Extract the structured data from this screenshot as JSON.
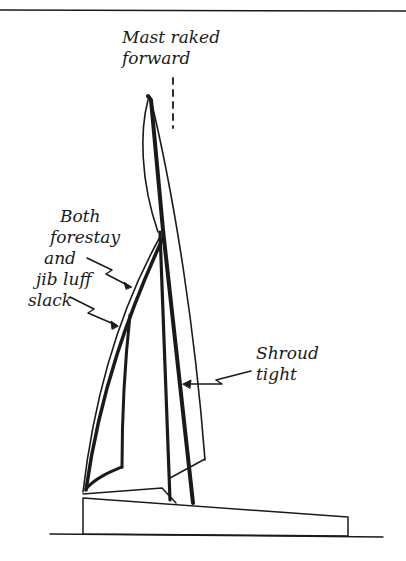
{
  "figure": {
    "type": "rig-tuning-diagram",
    "colors": {
      "ink": "#1a1a1a",
      "background": "#ffffff"
    }
  },
  "annotations": {
    "mast": {
      "line1": "Mast raked",
      "line2": "forward"
    },
    "forestay": {
      "line1": "Both",
      "line2": "forestay",
      "line3": "and",
      "line4": "jib luff",
      "line5": "slack"
    },
    "shroud": {
      "line1": "Shroud",
      "line2": "tight"
    }
  }
}
